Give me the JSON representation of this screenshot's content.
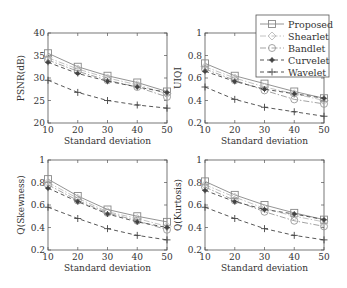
{
  "chart_data": [
    {
      "type": "line",
      "title": "",
      "xlabel": "Standard deviation",
      "ylabel": "PSNR(dB)",
      "x": [
        10,
        20,
        30,
        40,
        50
      ],
      "xlim": [
        10,
        50
      ],
      "ylim": [
        20,
        40
      ],
      "xticks": [
        10,
        20,
        30,
        40,
        50
      ],
      "yticks": [
        20,
        25,
        30,
        35,
        40
      ],
      "grid": false,
      "series": [
        {
          "name": "Proposed",
          "values": [
            35.5,
            32.5,
            30.5,
            29.0,
            27.0
          ]
        },
        {
          "name": "Shearlet",
          "values": [
            34.5,
            32.0,
            30.0,
            28.5,
            26.5
          ]
        },
        {
          "name": "Bandlet",
          "values": [
            34.0,
            31.5,
            29.5,
            28.0,
            25.8
          ]
        },
        {
          "name": "Curvelet",
          "values": [
            33.5,
            31.0,
            29.3,
            28.0,
            26.8
          ]
        },
        {
          "name": "Wavelet",
          "values": [
            29.5,
            26.8,
            25.0,
            24.0,
            23.3
          ]
        }
      ]
    },
    {
      "type": "line",
      "title": "",
      "xlabel": "Standard deviation",
      "ylabel": "UIQI",
      "x": [
        10,
        20,
        30,
        40,
        50
      ],
      "xlim": [
        10,
        50
      ],
      "ylim": [
        0.2,
        1
      ],
      "xticks": [
        10,
        20,
        30,
        40,
        50
      ],
      "yticks": [
        0.2,
        0.4,
        0.6,
        0.8,
        1
      ],
      "grid": false,
      "legend_position": "upper right",
      "series": [
        {
          "name": "Proposed",
          "values": [
            0.73,
            0.62,
            0.55,
            0.48,
            0.42
          ]
        },
        {
          "name": "Shearlet",
          "values": [
            0.7,
            0.6,
            0.52,
            0.46,
            0.4
          ]
        },
        {
          "name": "Bandlet",
          "values": [
            0.68,
            0.58,
            0.49,
            0.41,
            0.37
          ]
        },
        {
          "name": "Curvelet",
          "values": [
            0.66,
            0.57,
            0.5,
            0.46,
            0.42
          ]
        },
        {
          "name": "Wavelet",
          "values": [
            0.52,
            0.41,
            0.34,
            0.3,
            0.26
          ]
        }
      ]
    },
    {
      "type": "line",
      "title": "",
      "xlabel": "Standard deviation",
      "ylabel": "Q(Skewness)",
      "x": [
        10,
        20,
        30,
        40,
        50
      ],
      "xlim": [
        10,
        50
      ],
      "ylim": [
        0.2,
        1
      ],
      "xticks": [
        10,
        20,
        30,
        40,
        50
      ],
      "yticks": [
        0.2,
        0.4,
        0.6,
        0.8,
        1
      ],
      "grid": false,
      "series": [
        {
          "name": "Proposed",
          "values": [
            0.83,
            0.68,
            0.56,
            0.5,
            0.45
          ]
        },
        {
          "name": "Shearlet",
          "values": [
            0.8,
            0.66,
            0.54,
            0.48,
            0.41
          ]
        },
        {
          "name": "Bandlet",
          "values": [
            0.78,
            0.64,
            0.53,
            0.46,
            0.38
          ]
        },
        {
          "name": "Curvelet",
          "values": [
            0.75,
            0.63,
            0.52,
            0.45,
            0.4
          ]
        },
        {
          "name": "Wavelet",
          "values": [
            0.58,
            0.48,
            0.39,
            0.33,
            0.29
          ]
        }
      ]
    },
    {
      "type": "line",
      "title": "",
      "xlabel": "Standard deviation",
      "ylabel": "Q(Kurtosis)",
      "x": [
        10,
        20,
        30,
        40,
        50
      ],
      "xlim": [
        10,
        50
      ],
      "ylim": [
        0.2,
        1
      ],
      "xticks": [
        10,
        20,
        30,
        40,
        50
      ],
      "yticks": [
        0.2,
        0.4,
        0.6,
        0.8,
        1
      ],
      "grid": false,
      "series": [
        {
          "name": "Proposed",
          "values": [
            0.81,
            0.69,
            0.6,
            0.53,
            0.47
          ]
        },
        {
          "name": "Shearlet",
          "values": [
            0.78,
            0.67,
            0.57,
            0.5,
            0.45
          ]
        },
        {
          "name": "Bandlet",
          "values": [
            0.76,
            0.64,
            0.54,
            0.46,
            0.41
          ]
        },
        {
          "name": "Curvelet",
          "values": [
            0.73,
            0.63,
            0.56,
            0.52,
            0.47
          ]
        },
        {
          "name": "Wavelet",
          "values": [
            0.58,
            0.48,
            0.39,
            0.33,
            0.29
          ]
        }
      ]
    }
  ],
  "legend": {
    "items": [
      {
        "label": "Proposed",
        "marker": "square",
        "line": "solid",
        "color": "#888888"
      },
      {
        "label": "Shearlet",
        "marker": "diamond",
        "line": "dashdot",
        "color": "#bbbbbb"
      },
      {
        "label": "Bandlet",
        "marker": "circle",
        "line": "dashdot",
        "color": "#999999"
      },
      {
        "label": "Curvelet",
        "marker": "star",
        "line": "dashed",
        "color": "#444444"
      },
      {
        "label": "Wavelet",
        "marker": "plus",
        "line": "dashed",
        "color": "#444444"
      }
    ]
  },
  "styles": {
    "axis_color": "#555555",
    "text_color": "#333333"
  }
}
